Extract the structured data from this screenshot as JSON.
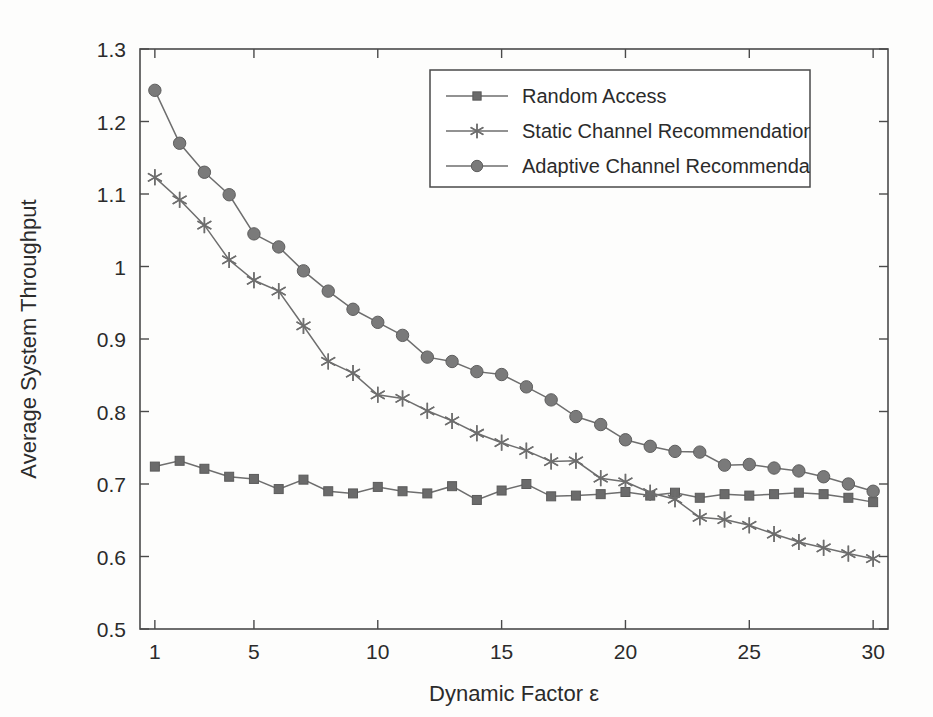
{
  "figure": {
    "background_color": "#fdfdfc",
    "axis_color": "#4a4a4a",
    "series_color": "#6e6e6e"
  },
  "chart_data": {
    "type": "line",
    "title": "",
    "xlabel": "Dynamic Factor ε",
    "ylabel": "Average System Throughput",
    "xlim": [
      0.4,
      30.6
    ],
    "ylim": [
      0.5,
      1.3
    ],
    "xticks": [
      1,
      5,
      10,
      15,
      20,
      25,
      30
    ],
    "xticklabels": [
      "1",
      "5",
      "10",
      "15",
      "20",
      "25",
      "30"
    ],
    "yticks": [
      0.5,
      0.6,
      0.7,
      0.8,
      0.9,
      1.0,
      1.1,
      1.2,
      1.3
    ],
    "yticklabels": [
      "0.5",
      "0.6",
      "0.7",
      "0.8",
      "0.9",
      "1",
      "1.1",
      "1.2",
      "1.3"
    ],
    "grid": false,
    "legend_position": "top-center",
    "x": [
      1,
      2,
      3,
      4,
      5,
      6,
      7,
      8,
      9,
      10,
      11,
      12,
      13,
      14,
      15,
      16,
      17,
      18,
      19,
      20,
      21,
      22,
      23,
      24,
      25,
      26,
      27,
      28,
      29,
      30
    ],
    "series": [
      {
        "name": "Random Access",
        "marker": "square",
        "values": [
          0.724,
          0.732,
          0.721,
          0.71,
          0.707,
          0.693,
          0.706,
          0.69,
          0.687,
          0.696,
          0.69,
          0.687,
          0.697,
          0.678,
          0.691,
          0.7,
          0.683,
          0.684,
          0.686,
          0.689,
          0.684,
          0.688,
          0.681,
          0.686,
          0.684,
          0.686,
          0.688,
          0.686,
          0.681,
          0.675
        ]
      },
      {
        "name": "Static Channel Recommendation",
        "marker": "star",
        "values": [
          1.123,
          1.092,
          1.057,
          1.009,
          0.981,
          0.966,
          0.918,
          0.869,
          0.853,
          0.823,
          0.818,
          0.801,
          0.787,
          0.77,
          0.757,
          0.746,
          0.731,
          0.732,
          0.708,
          0.703,
          0.688,
          0.679,
          0.654,
          0.651,
          0.643,
          0.631,
          0.62,
          0.612,
          0.604,
          0.597
        ]
      },
      {
        "name": "Adaptive Channel Recommendatio",
        "marker": "circle",
        "values": [
          1.243,
          1.17,
          1.13,
          1.099,
          1.045,
          1.027,
          0.994,
          0.966,
          0.941,
          0.923,
          0.905,
          0.875,
          0.869,
          0.855,
          0.851,
          0.834,
          0.816,
          0.793,
          0.782,
          0.761,
          0.752,
          0.745,
          0.744,
          0.726,
          0.727,
          0.722,
          0.718,
          0.71,
          0.7,
          0.69
        ]
      }
    ]
  },
  "legend": {
    "entries": [
      {
        "label": "Random Access",
        "marker": "square"
      },
      {
        "label": "Static Channel Recommendation",
        "marker": "star"
      },
      {
        "label": "Adaptive Channel Recommendatio",
        "marker": "circle"
      }
    ]
  }
}
